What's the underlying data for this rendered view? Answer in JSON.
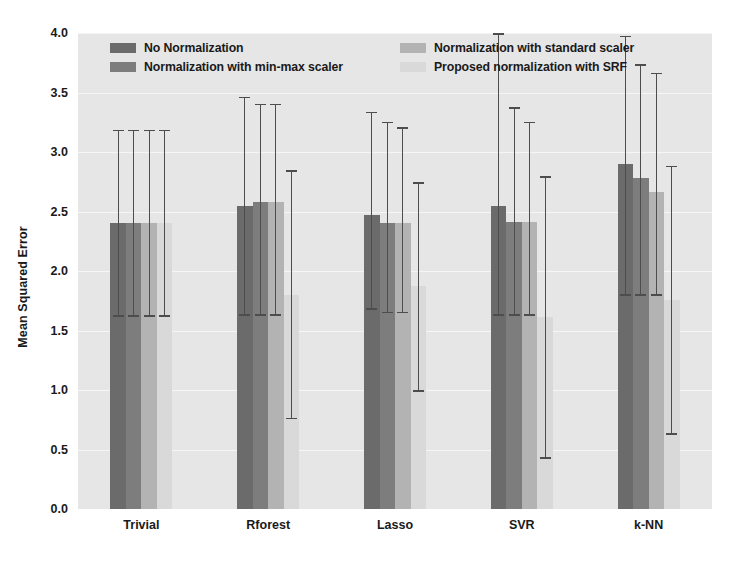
{
  "chart_data": {
    "type": "bar",
    "title": "",
    "xlabel": "",
    "ylabel": "Mean Squared Error",
    "ylim": [
      0.0,
      4.0
    ],
    "ytick_labels": [
      "0.0",
      "0.5",
      "1.0",
      "1.5",
      "2.0",
      "2.5",
      "3.0",
      "3.5",
      "4.0"
    ],
    "ytick_values": [
      0.0,
      0.5,
      1.0,
      1.5,
      2.0,
      2.5,
      3.0,
      3.5,
      4.0
    ],
    "grid": true,
    "grid_axis": "y",
    "legend_position": "upper-center",
    "categories": [
      "Trivial",
      "Rforest",
      "Lasso",
      "SVR",
      "k-NN"
    ],
    "series": [
      {
        "name": "No Normalization",
        "color": "#6b6b6b",
        "values": [
          2.4,
          2.55,
          2.47,
          2.55,
          2.9
        ],
        "err_low": [
          1.62,
          1.63,
          1.68,
          1.63,
          1.8
        ],
        "err_high": [
          3.18,
          3.46,
          3.33,
          3.99,
          3.97
        ]
      },
      {
        "name": "Normalization with min-max scaler",
        "color": "#7d7d7d",
        "values": [
          2.4,
          2.58,
          2.4,
          2.41,
          2.78
        ],
        "err_low": [
          1.62,
          1.63,
          1.65,
          1.63,
          1.8
        ],
        "err_high": [
          3.18,
          3.4,
          3.25,
          3.37,
          3.73
        ]
      },
      {
        "name": "Normalization with standard scaler",
        "color": "#b3b3b3",
        "values": [
          2.4,
          2.58,
          2.4,
          2.41,
          2.66
        ],
        "err_low": [
          1.62,
          1.63,
          1.65,
          1.63,
          1.8
        ],
        "err_high": [
          3.18,
          3.4,
          3.2,
          3.25,
          3.66
        ]
      },
      {
        "name": "Proposed normalization with SRF",
        "color": "#d9d9d9",
        "values": [
          2.4,
          1.8,
          1.87,
          1.61,
          1.76
        ],
        "err_low": [
          1.62,
          0.76,
          0.99,
          0.43,
          0.63
        ],
        "err_high": [
          3.18,
          2.84,
          2.74,
          2.79,
          2.88
        ]
      }
    ],
    "style": {
      "plot_background": "#e6e6e6",
      "gridline_color": "#f6f6f6",
      "figure_background": "#ffffff",
      "error_bar_color": "#4d4d4d",
      "text_color": "#1a1a1a"
    }
  },
  "legend": {
    "items": [
      {
        "label": "No Normalization",
        "color": "#6b6b6b"
      },
      {
        "label": "Normalization with standard scaler",
        "color": "#b3b3b3"
      },
      {
        "label": "Normalization with min-max scaler",
        "color": "#7d7d7d"
      },
      {
        "label": "Proposed normalization with SRF",
        "color": "#d9d9d9"
      }
    ]
  }
}
